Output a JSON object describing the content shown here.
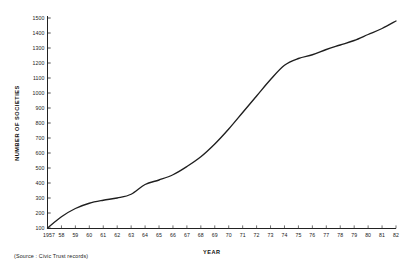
{
  "chart_data": {
    "type": "line",
    "title": "",
    "xlabel": "YEAR",
    "ylabel": "NUMBER OF SOCIETIES",
    "xlim": [
      1957,
      1982
    ],
    "ylim": [
      0,
      1500
    ],
    "grid": false,
    "legend": null,
    "source_note": "(Source : Civic Trust records)",
    "y_ticks": [
      100,
      200,
      300,
      400,
      500,
      600,
      700,
      800,
      900,
      1000,
      1100,
      1200,
      1300,
      1400,
      1500
    ],
    "y_tick_labels": [
      "100",
      "200",
      "300",
      "400",
      "500",
      "600",
      "700",
      "800",
      "900",
      "1000",
      "1100",
      "1200",
      "1300",
      "1400",
      "1500"
    ],
    "x_ticks": [
      1957,
      1958,
      1959,
      1960,
      1961,
      1962,
      1963,
      1964,
      1965,
      1966,
      1967,
      1968,
      1969,
      1970,
      1971,
      1972,
      1973,
      1974,
      1975,
      1976,
      1977,
      1978,
      1979,
      1980,
      1981,
      1982
    ],
    "x_tick_labels": [
      "1957",
      "58",
      "59",
      "60",
      "61",
      "62",
      "63",
      "64",
      "65",
      "66",
      "67",
      "68",
      "69",
      "70",
      "71",
      "72",
      "73",
      "74",
      "75",
      "76",
      "77",
      "78",
      "79",
      "80",
      "81",
      "82"
    ],
    "series": [
      {
        "name": "Number of societies",
        "color": "#1f1f1f",
        "x": [
          1957,
          1958,
          1959,
          1960,
          1961,
          1962,
          1963,
          1964,
          1965,
          1966,
          1967,
          1968,
          1969,
          1970,
          1971,
          1972,
          1973,
          1974,
          1975,
          1976,
          1977,
          1978,
          1979,
          1980,
          1981,
          1982
        ],
        "values": [
          100,
          175,
          230,
          265,
          285,
          300,
          325,
          390,
          420,
          455,
          510,
          575,
          660,
          760,
          870,
          980,
          1090,
          1185,
          1230,
          1255,
          1290,
          1320,
          1350,
          1390,
          1430,
          1480
        ]
      }
    ]
  }
}
